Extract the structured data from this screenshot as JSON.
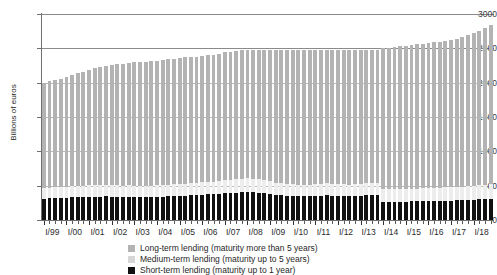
{
  "chart_data": {
    "type": "bar",
    "title": "",
    "subtitle": "",
    "xlabel": "",
    "ylabel": "Billions of euros",
    "ylim": [
      0,
      3000
    ],
    "yticks": [
      0,
      500,
      1000,
      1500,
      2000,
      2500,
      3000
    ],
    "grid": true,
    "stacked": true,
    "legend_position": "bottom",
    "x_tick_labels": [
      "I/99",
      "I/00",
      "I/01",
      "I/02",
      "I/03",
      "I/04",
      "I/05",
      "I/06",
      "I/07",
      "I/08",
      "I/09",
      "I/10",
      "I/11",
      "I/12",
      "I/13",
      "I/14",
      "I/15",
      "I/16",
      "I/17",
      "I/18"
    ],
    "x_note": "Each year label spans four quarterly bars",
    "categories": [
      "I/99",
      "II/99",
      "III/99",
      "IV/99",
      "I/00",
      "II/00",
      "III/00",
      "IV/00",
      "I/01",
      "II/01",
      "III/01",
      "IV/01",
      "I/02",
      "II/02",
      "III/02",
      "IV/02",
      "I/03",
      "II/03",
      "III/03",
      "IV/03",
      "I/04",
      "II/04",
      "III/04",
      "IV/04",
      "I/05",
      "II/05",
      "III/05",
      "IV/05",
      "I/06",
      "II/06",
      "III/06",
      "IV/06",
      "I/07",
      "II/07",
      "III/07",
      "IV/07",
      "I/08",
      "II/08",
      "III/08",
      "IV/08",
      "I/09",
      "II/09",
      "III/09",
      "IV/09",
      "I/10",
      "II/10",
      "III/10",
      "IV/10",
      "I/11",
      "II/11",
      "III/11",
      "IV/11",
      "I/12",
      "II/12",
      "III/12",
      "IV/12",
      "I/13",
      "II/13",
      "III/13",
      "IV/13",
      "I/14",
      "II/14",
      "III/14",
      "IV/14",
      "I/15",
      "II/15",
      "III/15",
      "IV/15",
      "I/16",
      "II/16",
      "III/16",
      "IV/16",
      "I/17",
      "II/17",
      "III/17",
      "IV/17",
      "I/18",
      "II/18",
      "III/18",
      "IV/18"
    ],
    "series": [
      {
        "name": "Short-term lending (maturity up to 1 year)",
        "color": "#111111",
        "values": [
          310,
          315,
          318,
          322,
          325,
          330,
          333,
          336,
          338,
          340,
          342,
          345,
          342,
          340,
          338,
          340,
          338,
          336,
          335,
          338,
          340,
          342,
          345,
          348,
          352,
          355,
          358,
          362,
          368,
          372,
          376,
          380,
          390,
          396,
          400,
          404,
          408,
          404,
          398,
          390,
          378,
          366,
          358,
          352,
          348,
          346,
          344,
          346,
          352,
          356,
          358,
          356,
          352,
          348,
          345,
          348,
          352,
          358,
          362,
          366,
          268,
          266,
          264,
          266,
          268,
          270,
          272,
          274,
          276,
          278,
          280,
          282,
          284,
          286,
          288,
          292,
          296,
          300,
          304,
          310
        ]
      },
      {
        "name": "Medium-term lending (maturity up to 5 years)",
        "color": "#ededed",
        "values": [
          155,
          156,
          157,
          158,
          160,
          162,
          163,
          164,
          165,
          166,
          167,
          168,
          166,
          165,
          164,
          165,
          164,
          163,
          163,
          164,
          165,
          166,
          168,
          170,
          172,
          174,
          176,
          178,
          180,
          182,
          184,
          186,
          190,
          192,
          194,
          196,
          198,
          196,
          194,
          190,
          185,
          180,
          176,
          173,
          171,
          170,
          169,
          170,
          172,
          174,
          175,
          174,
          172,
          170,
          169,
          170,
          172,
          174,
          176,
          178,
          180,
          181,
          182,
          183,
          184,
          185,
          186,
          188,
          190,
          191,
          192,
          194,
          196,
          198,
          200,
          202,
          204,
          206,
          208,
          212
        ]
      },
      {
        "name": "Long-term lending (maturity more than 5 years)",
        "color": "#b3b3b3",
        "values": [
          1535,
          1549,
          1565,
          1580,
          1595,
          1618,
          1639,
          1660,
          1682,
          1704,
          1720,
          1737,
          1752,
          1765,
          1777,
          1785,
          1793,
          1801,
          1802,
          1808,
          1815,
          1822,
          1827,
          1832,
          1836,
          1839,
          1841,
          1840,
          1842,
          1846,
          1850,
          1854,
          1860,
          1862,
          1866,
          1870,
          1874,
          1880,
          1888,
          1900,
          1912,
          1924,
          1936,
          1945,
          1951,
          1954,
          1957,
          1954,
          1946,
          1940,
          1937,
          1940,
          1946,
          1952,
          1956,
          1952,
          1946,
          1938,
          1934,
          1930,
          2052,
          2063,
          2074,
          2081,
          2088,
          2095,
          2102,
          2108,
          2114,
          2121,
          2128,
          2134,
          2140,
          2156,
          2182,
          2206,
          2230,
          2254,
          2288,
          2318
        ]
      }
    ],
    "legend": [
      {
        "label": "Long-term lending (maturity more than 5 years)",
        "color": "#b3b3b3"
      },
      {
        "label": "Medium-term lending (maturity up to 5 years)",
        "color": "#d6d6d6"
      },
      {
        "label": "Short-term lending (maturity up to 1 year)",
        "color": "#111111"
      }
    ]
  }
}
